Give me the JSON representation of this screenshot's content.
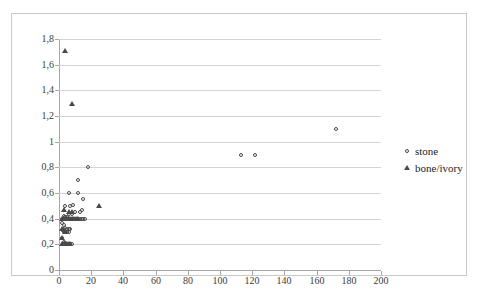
{
  "chart_data": {
    "type": "scatter",
    "title": "",
    "subtitle": "",
    "xlabel": "",
    "ylabel": "",
    "xlim": [
      0,
      200
    ],
    "ylim": [
      0,
      1.8
    ],
    "xticks": [
      "0",
      "20",
      "40",
      "60",
      "80",
      "100",
      "120",
      "140",
      "160",
      "180",
      "200"
    ],
    "xtick_values": [
      0,
      20,
      40,
      60,
      80,
      100,
      120,
      140,
      160,
      180,
      200
    ],
    "yticks": [
      "0",
      "0,2",
      "0,4",
      "0,6",
      "0,8",
      "1",
      "1,2",
      "1,4",
      "1,6",
      "1,8"
    ],
    "ytick_values": [
      0,
      0.2,
      0.4,
      0.6,
      0.8,
      1.0,
      1.2,
      1.4,
      1.6,
      1.8
    ],
    "decimal_separator": ",",
    "grid": "horizontal",
    "legend_position": "right",
    "series": [
      {
        "name": "stone",
        "marker": "circle-open",
        "color": "#4a4a4a",
        "points": [
          [
            172,
            1.1
          ],
          [
            113,
            0.9
          ],
          [
            122,
            0.9
          ],
          [
            18,
            0.8
          ],
          [
            12,
            0.7
          ],
          [
            6,
            0.6
          ],
          [
            12,
            0.6
          ],
          [
            15,
            0.55
          ],
          [
            4,
            0.5
          ],
          [
            7,
            0.5
          ],
          [
            9,
            0.51
          ],
          [
            10,
            0.45
          ],
          [
            13,
            0.45
          ],
          [
            14,
            0.47
          ],
          [
            6,
            0.44
          ],
          [
            8,
            0.44
          ],
          [
            3,
            0.42
          ],
          [
            4,
            0.41
          ],
          [
            5,
            0.4
          ],
          [
            6,
            0.4
          ],
          [
            7,
            0.4
          ],
          [
            8,
            0.4
          ],
          [
            9,
            0.4
          ],
          [
            10,
            0.4
          ],
          [
            11,
            0.4
          ],
          [
            12,
            0.4
          ],
          [
            13,
            0.4
          ],
          [
            14,
            0.4
          ],
          [
            15,
            0.4
          ],
          [
            16,
            0.4
          ],
          [
            2,
            0.4
          ],
          [
            3,
            0.4
          ],
          [
            4,
            0.4
          ],
          [
            5,
            0.41
          ],
          [
            2,
            0.37
          ],
          [
            3,
            0.35
          ],
          [
            4,
            0.33
          ],
          [
            5,
            0.32
          ],
          [
            6,
            0.32
          ],
          [
            7,
            0.32
          ],
          [
            3,
            0.3
          ],
          [
            4,
            0.3
          ],
          [
            5,
            0.3
          ],
          [
            6,
            0.3
          ],
          [
            2,
            0.25
          ],
          [
            3,
            0.22
          ],
          [
            4,
            0.21
          ],
          [
            5,
            0.2
          ],
          [
            6,
            0.2
          ],
          [
            7,
            0.2
          ],
          [
            8,
            0.2
          ]
        ]
      },
      {
        "name": "bone/ivory",
        "marker": "triangle-filled",
        "color": "#4a4a4a",
        "points": [
          [
            4,
            1.71
          ],
          [
            8,
            1.29
          ],
          [
            25,
            0.5
          ],
          [
            3,
            0.47
          ],
          [
            6,
            0.45
          ],
          [
            8,
            0.45
          ],
          [
            2,
            0.4
          ],
          [
            3,
            0.4
          ],
          [
            4,
            0.4
          ],
          [
            5,
            0.4
          ],
          [
            6,
            0.4
          ],
          [
            7,
            0.4
          ],
          [
            8,
            0.4
          ],
          [
            9,
            0.4
          ],
          [
            10,
            0.4
          ],
          [
            11,
            0.4
          ],
          [
            12,
            0.4
          ],
          [
            2,
            0.32
          ],
          [
            3,
            0.31
          ],
          [
            4,
            0.3
          ],
          [
            2,
            0.25
          ],
          [
            2,
            0.2
          ],
          [
            3,
            0.2
          ],
          [
            4,
            0.2
          ],
          [
            5,
            0.2
          ],
          [
            6,
            0.2
          ],
          [
            7,
            0.2
          ]
        ]
      }
    ]
  },
  "legend": {
    "items": [
      {
        "label": "stone",
        "marker": "circle-open"
      },
      {
        "label": "bone/ivory",
        "marker": "triangle-filled"
      }
    ]
  }
}
